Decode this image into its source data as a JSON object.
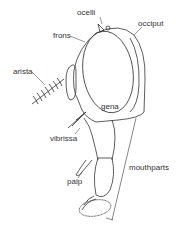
{
  "diagram": {
    "labels": {
      "ocelli": "ocelli",
      "occiput": "occiput",
      "frons": "frons",
      "arista": "arista",
      "gena": "gena",
      "vibrissa": "vibrissa",
      "palp": "palp",
      "mouthparts": "mouthparts"
    }
  }
}
